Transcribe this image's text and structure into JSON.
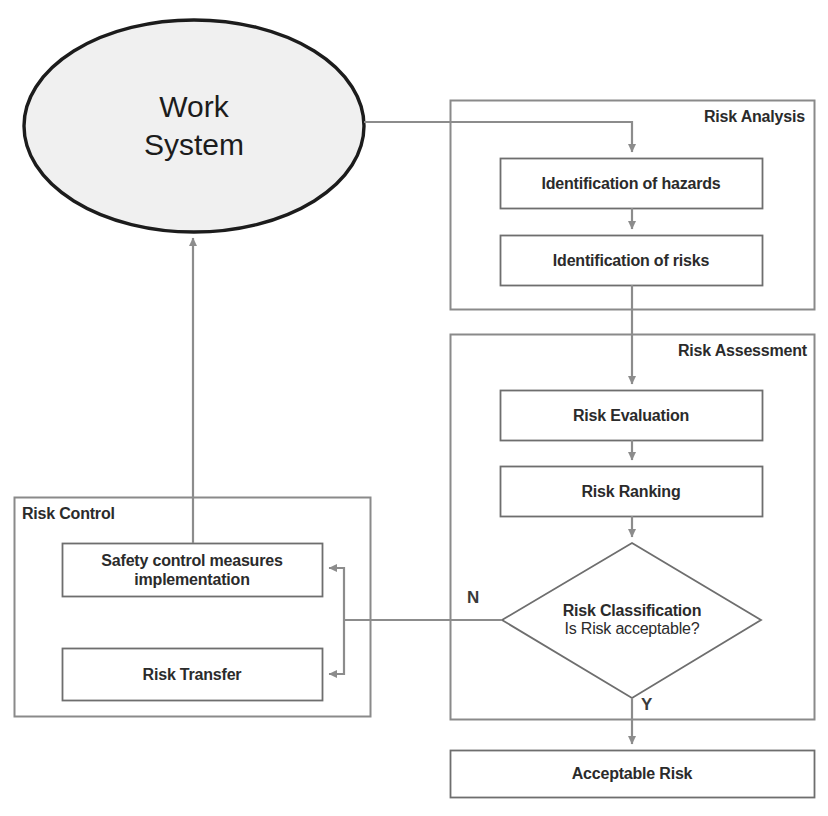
{
  "diagram": {
    "colors": {
      "background": "#ffffff",
      "ellipse_fill": "#f0f0f0",
      "ellipse_stroke": "#1c1c1c",
      "box_stroke": "#6e6e6e",
      "group_stroke": "#8a8a8a",
      "connector": "#8c8c8c",
      "text": "#2b2b2b"
    },
    "source_node": {
      "name": "work-system",
      "line1": "Work",
      "line2": "System"
    },
    "groups": [
      {
        "key": "risk-analysis",
        "title": "Risk Analysis",
        "steps": [
          {
            "key": "identification-of-hazards",
            "label": "Identification of hazards"
          },
          {
            "key": "identification-of-risks",
            "label": "Identification of risks"
          }
        ]
      },
      {
        "key": "risk-assessment",
        "title": "Risk Assessment",
        "steps": [
          {
            "key": "risk-evaluation",
            "label": "Risk Evaluation"
          },
          {
            "key": "risk-ranking",
            "label": "Risk Ranking"
          }
        ],
        "decision": {
          "key": "risk-classification",
          "label": "Risk Classification",
          "question": "Is Risk acceptable?",
          "branch_no": "N",
          "branch_yes": "Y"
        }
      },
      {
        "key": "risk-control",
        "title": "Risk Control",
        "steps": [
          {
            "key": "safety-control-measures-implementation",
            "label": "Safety control measures implementation"
          },
          {
            "key": "risk-transfer",
            "label": "Risk Transfer"
          }
        ]
      }
    ],
    "terminal_node": {
      "key": "acceptable-risk",
      "label": "Acceptable Risk"
    }
  }
}
